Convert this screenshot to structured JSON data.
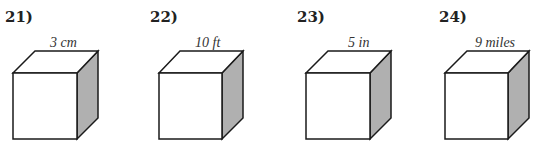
{
  "problems": [
    {
      "number": "21)",
      "side_label": "3 cm"
    },
    {
      "number": "22)",
      "side_label": "10 ft"
    },
    {
      "number": "23)",
      "side_label": "5 in"
    },
    {
      "number": "24)",
      "side_label": "9 miles"
    }
  ],
  "colors": {
    "edge": "#1a1a1a",
    "shaded_face": "#b0b0b0",
    "face": "#ffffff"
  }
}
